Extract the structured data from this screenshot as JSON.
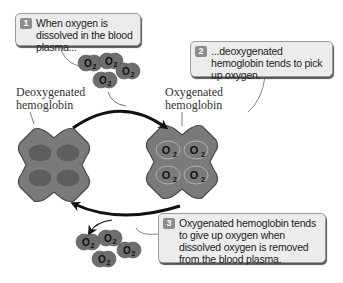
{
  "callouts": [
    {
      "number": "1",
      "text": "When oxygen is dissolved in the blood plasma..."
    },
    {
      "number": "2",
      "text": "...deoxygenated hemoglobin tends to pick up oxygen."
    },
    {
      "number": "3",
      "text": "Oxygenated hemoglobin tends to give up oxygen when dissolved oxygen is removed from the blood plasma."
    }
  ],
  "labels": {
    "deoxy": "Deoxygenated hemoglobin",
    "oxy": "Oxygenated hemoglobin"
  },
  "molecule": {
    "symbol": "O",
    "subscript": "2"
  },
  "colors": {
    "hemoglobin_fill": "#7a7a7a",
    "hemoglobin_stroke": "#4a4a4a",
    "molecule_fill": "#6e6e6e",
    "bubble_bg": "#ececec",
    "badge": "#8c8c8c",
    "arrow": "#111111"
  }
}
